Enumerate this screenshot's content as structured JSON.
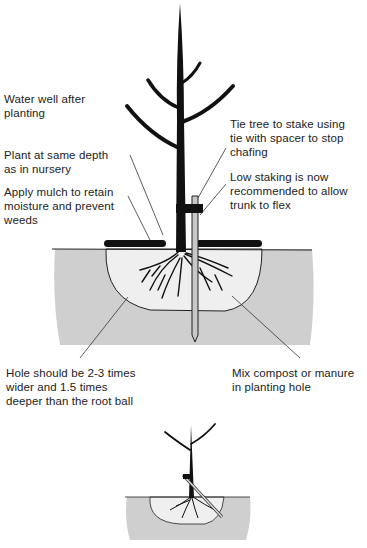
{
  "diagram": {
    "labels": {
      "water": "Water well after\nplanting",
      "depth": "Plant at same depth\nas in nursery",
      "mulch": "Apply mulch to retain\nmoisture and prevent\nweeds",
      "tie": "Tie tree to stake using\ntie with spacer to stop\nchafing",
      "staking": "Low staking is now\nrecommended to allow\ntrunk to flex",
      "hole": "Hole should be 2-3 times\nwider and 1.5 times\ndeeper than the root ball",
      "compost": "Mix compost or manure\nin planting hole"
    },
    "colors": {
      "soil": "#cfcfcf",
      "hole_fill": "#efefef",
      "ink": "#111111",
      "stake": "#c8c8c8"
    }
  }
}
